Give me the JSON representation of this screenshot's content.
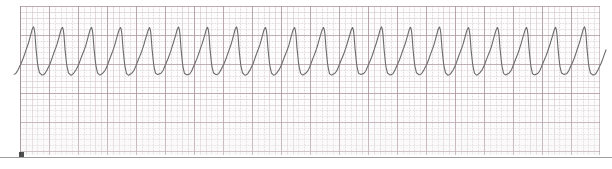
{
  "document": {
    "kind": "ecg-rhythm-strip",
    "title": "ECG Rhythm Strip",
    "paper_color": "#fdfdfd",
    "background_color": "#ffffff",
    "grid_fine_color": "#c4b2ba",
    "grid_bold_color": "#ac96a0",
    "trace_color": "#6a6a6a",
    "scan_edge_color": "#8d8d8d",
    "ink_speck_color": "#3a3a3a"
  },
  "paper": {
    "left": 20,
    "top": 6,
    "width": 580,
    "height": 149,
    "small_box_px": 5.8,
    "large_box_px": 29,
    "large_boxes_across": 20,
    "large_boxes_down": 5
  },
  "chart_data": {
    "type": "line",
    "title": "",
    "subtitle": "",
    "xlabel": "",
    "ylabel": "",
    "grid": true,
    "legend": null,
    "annotations": [],
    "xlim": [
      0,
      612
    ],
    "ylim": [
      0,
      169
    ],
    "axis_note": "pixel coordinates of the scanned strip; y increases downward",
    "waveform": {
      "name": "ecg-lead-trace",
      "morphology": "wide-complex sine-like tachycardia",
      "cycle_count": 20,
      "period_px": 29,
      "peak_y_px": 27,
      "trough_y_px": 75,
      "amplitude_px": 48,
      "baseline_y_px": 51,
      "start_x_px": 14,
      "end_x_px": 606,
      "stroke_width_px": 1.1,
      "phase_offset_px": 7,
      "shape_profile": [
        {
          "t": 0.0,
          "y_norm": 0.55
        },
        {
          "t": 0.06,
          "y_norm": 0.2
        },
        {
          "t": 0.12,
          "y_norm": 0.04
        },
        {
          "t": 0.2,
          "y_norm": 0.0
        },
        {
          "t": 0.3,
          "y_norm": 0.03
        },
        {
          "t": 0.38,
          "y_norm": 0.1
        },
        {
          "t": 0.47,
          "y_norm": 0.22
        },
        {
          "t": 0.56,
          "y_norm": 0.36
        },
        {
          "t": 0.64,
          "y_norm": 0.49
        },
        {
          "t": 0.72,
          "y_norm": 0.63
        },
        {
          "t": 0.8,
          "y_norm": 0.8
        },
        {
          "t": 0.87,
          "y_norm": 0.95
        },
        {
          "t": 0.92,
          "y_norm": 1.0
        },
        {
          "t": 0.96,
          "y_norm": 0.88
        },
        {
          "t": 1.0,
          "y_norm": 0.55
        }
      ],
      "peak_x_positions_px": [
        22,
        51,
        80,
        109,
        138,
        167,
        196,
        225,
        254,
        283,
        312,
        341,
        370,
        399,
        428,
        457,
        486,
        515,
        544,
        573
      ],
      "trough_x_positions_px": [
        40,
        69,
        98,
        127,
        156,
        185,
        214,
        243,
        272,
        301,
        330,
        359,
        388,
        417,
        446,
        475,
        504,
        533,
        562,
        591
      ]
    }
  },
  "artifacts": {
    "scan_edge_line": {
      "name": "scan-edge-line",
      "y": 157,
      "x_start": 0,
      "x_end": 612
    },
    "ink_speck": {
      "name": "ink-speck",
      "x": 19,
      "y": 152,
      "size": 5
    }
  }
}
